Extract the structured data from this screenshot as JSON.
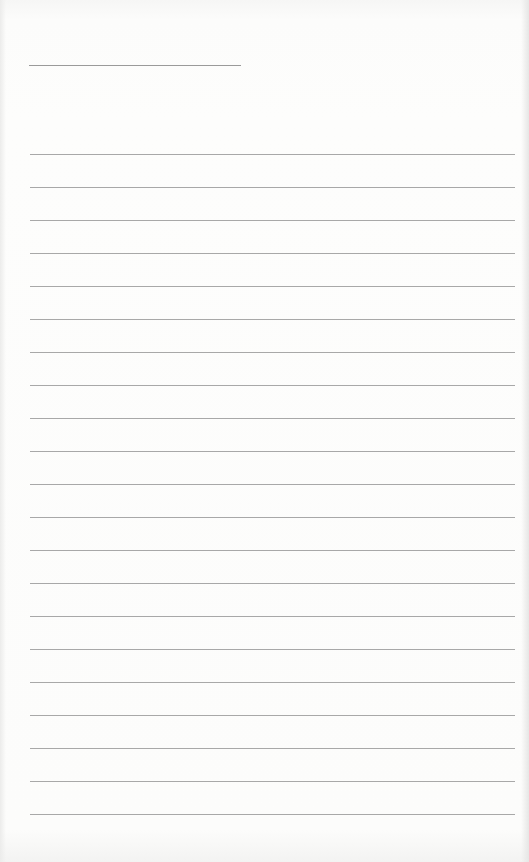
{
  "document": {
    "type": "lined-paper",
    "title": "",
    "line_count": 21,
    "lines": [
      "",
      "",
      "",
      "",
      "",
      "",
      "",
      "",
      "",
      "",
      "",
      "",
      "",
      "",
      "",
      "",
      "",
      "",
      "",
      "",
      ""
    ],
    "rule_color": "#a8a8a8",
    "paper_color": "#fbfbfa"
  }
}
